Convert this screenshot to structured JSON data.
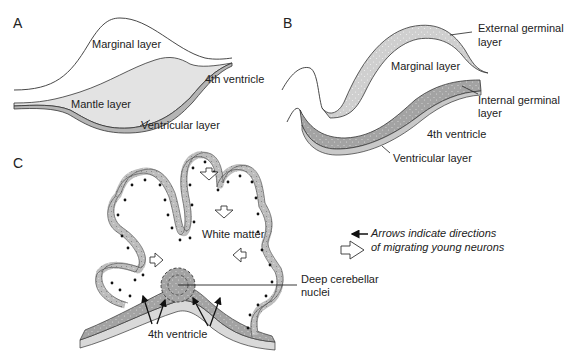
{
  "panels": {
    "a": {
      "letter": "A",
      "labels": {
        "marginal": "Marginal layer",
        "mantle": "Mantle layer",
        "ventricle": "4th ventricle",
        "ventricular": "Ventricular layer"
      }
    },
    "b": {
      "letter": "B",
      "labels": {
        "external_1": "External germinal",
        "external_2": "layer",
        "marginal": "Marginal layer",
        "internal_1": "Internal germinal",
        "internal_2": "layer",
        "ventricle": "4th ventricle",
        "ventricular": "Ventricular layer"
      }
    },
    "c": {
      "letter": "C",
      "labels": {
        "white_matter": "White matter",
        "deep_nuclei_1": "Deep cerebellar",
        "deep_nuclei_2": "nuclei",
        "ventricle": "4th ventricle"
      },
      "legend": {
        "line1": "Arrows indicate directions",
        "line2": "of migrating young neurons"
      }
    }
  },
  "colors": {
    "mantle_fill": "#e3e3e3",
    "ventricular_fill": "#b5b5b5",
    "external_fill": "#d6d6d6",
    "internal_fill": "#a9a9a9",
    "cortex_fill": "#c4c4c4",
    "stroke": "#333333"
  }
}
